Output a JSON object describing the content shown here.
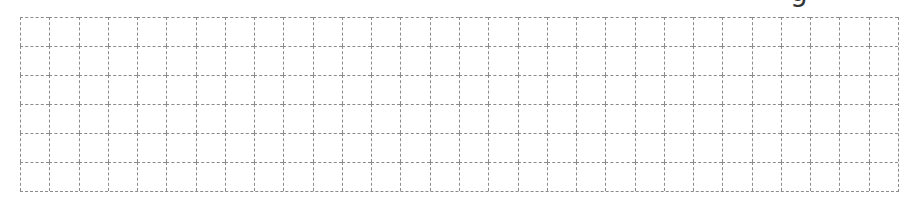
{
  "document": {
    "cropped_heading_fragment": "g"
  },
  "grid": {
    "rows": 6,
    "columns": 30,
    "line_color": "#8c8c8c",
    "line_style": "dashed",
    "background": "#ffffff"
  }
}
